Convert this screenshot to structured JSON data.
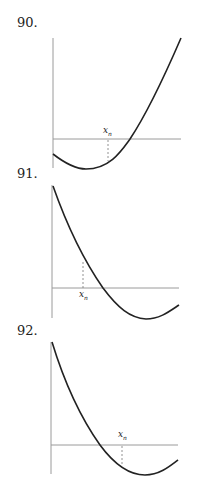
{
  "figures": [
    {
      "number": "90.",
      "label_x": "x",
      "label_sub": "n",
      "description": "Convex curve dipping below horizontal axis then rising steeply; x_n left of root on lower branch"
    },
    {
      "number": "91.",
      "label_x": "x",
      "label_sub": "n",
      "description": "Decreasing convex curve crossing axis then reaching minimum; x_n left of root on upper branch"
    },
    {
      "number": "92.",
      "label_x": "x",
      "label_sub": "n",
      "description": "Decreasing convex curve crossing axis then reaching minimum; x_n right of root below axis"
    }
  ],
  "colors": {
    "axis": "#9a9a9a",
    "curve": "#222222",
    "text": "#222222"
  }
}
